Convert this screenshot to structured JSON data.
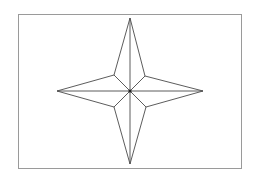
{
  "diagram": {
    "type": "four-pointed-star",
    "canvas": {
      "width": 259,
      "height": 179,
      "background": "#ffffff"
    },
    "frame": {
      "x": 18,
      "y": 14,
      "width": 223,
      "height": 154,
      "stroke": "#9a9a9a",
      "stroke_width": 1
    },
    "center": {
      "x": 130,
      "y": 91
    },
    "outer_points": {
      "top": {
        "x": 130,
        "y": 18
      },
      "right": {
        "x": 203,
        "y": 91
      },
      "bottom": {
        "x": 130,
        "y": 164
      },
      "left": {
        "x": 57,
        "y": 91
      }
    },
    "inner_points": {
      "upper_right": {
        "x": 145,
        "y": 76
      },
      "lower_right": {
        "x": 146,
        "y": 107
      },
      "lower_left": {
        "x": 114,
        "y": 107
      },
      "upper_left": {
        "x": 114,
        "y": 75
      }
    },
    "line_color": "#4a4a4a",
    "line_width": 0.9,
    "center_dot": {
      "radius": 1.6,
      "color": "#222222"
    }
  }
}
